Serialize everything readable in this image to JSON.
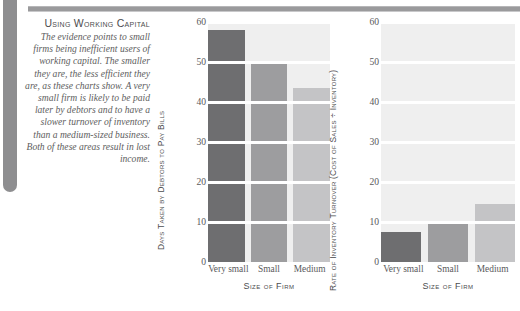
{
  "decor": {
    "top_rule_color": "#9a9a9c",
    "left_rule_color": "#8e8e90"
  },
  "caption": {
    "title": "Using Working Capital",
    "body": "The evidence points to small firms being inefficient users of working capital. The smaller they are, the less efficient they are, as these charts show. A very small firm is likely to be paid later by debtors and to have a slower turnover of inventory than a medium-sized business. Both of these areas result in lost income."
  },
  "palette": {
    "bar_very_small": "#6e6e70",
    "bar_small": "#9d9d9f",
    "bar_medium": "#c4c4c6",
    "plot_background": "#efefef",
    "gridline": "#ffffff",
    "text": "#5a5a5c"
  },
  "chart_data": [
    {
      "type": "bar",
      "title": "",
      "categories": [
        "Very small",
        "Small",
        "Medium"
      ],
      "values": [
        58,
        50,
        43.5
      ],
      "xlabel": "Size of Firm",
      "ylabel": "Days Taken by Debtors to Pay Bills",
      "ylim": [
        0,
        60
      ],
      "yticks": [
        60,
        50,
        40,
        30,
        20,
        10,
        0
      ],
      "grid": true,
      "legend": "none",
      "colors": [
        "#6e6e70",
        "#9d9d9f",
        "#c4c4c6"
      ]
    },
    {
      "type": "bar",
      "title": "",
      "categories": [
        "Very small",
        "Small",
        "Medium"
      ],
      "values": [
        7.5,
        10,
        14.5
      ],
      "xlabel": "Size of Firm",
      "ylabel": "Rate of Inventory Turnover (Cost of Sales ÷ Inventory)",
      "ylim": [
        0,
        60
      ],
      "yticks": [
        60,
        50,
        40,
        30,
        20,
        10,
        0
      ],
      "grid": true,
      "legend": "none",
      "colors": [
        "#6e6e70",
        "#9d9d9f",
        "#c4c4c6"
      ]
    }
  ]
}
